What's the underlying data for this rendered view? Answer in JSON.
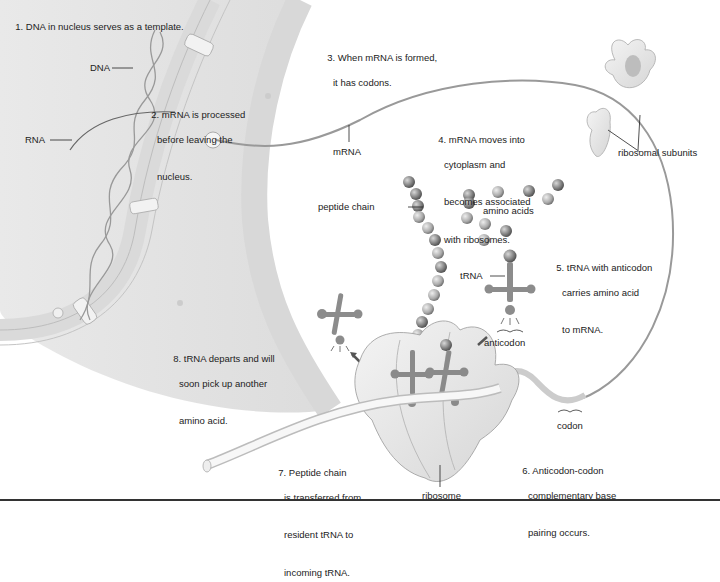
{
  "figure": {
    "type": "protein-synthesis-diagram",
    "steps": [
      {
        "n": "1.",
        "lines": [
          "DNA in nucleus serves as a template."
        ]
      },
      {
        "n": "2.",
        "lines": [
          "mRNA is processed",
          "before leaving the",
          "nucleus."
        ]
      },
      {
        "n": "3.",
        "lines": [
          "When mRNA is formed,",
          "it has codons."
        ]
      },
      {
        "n": "4.",
        "lines": [
          "mRNA moves into",
          "cytoplasm and",
          "becomes associated",
          "with ribosomes."
        ]
      },
      {
        "n": "5.",
        "lines": [
          "tRNA with anticodon",
          "carries amino acid",
          "to mRNA."
        ]
      },
      {
        "n": "6.",
        "lines": [
          "Anticodon-codon",
          "complementary base",
          "pairing occurs."
        ]
      },
      {
        "n": "7.",
        "lines": [
          "Peptide chain",
          "is transferred from",
          "resident tRNA to",
          "incoming tRNA."
        ]
      },
      {
        "n": "8.",
        "lines": [
          "tRNA departs and will",
          "soon pick up another",
          "amino acid."
        ]
      }
    ],
    "labels": {
      "dna": "DNA",
      "rna": "RNA",
      "mrna": "mRNA",
      "ribosomal_subunits": "ribosomal subunits",
      "peptide_chain": "peptide chain",
      "amino_acids": "amino acids",
      "trna": "tRNA",
      "anticodon": "anticodon",
      "codon": "codon",
      "ribosome": "ribosome"
    },
    "colors": {
      "nucleus_fill": "#e6e6e6",
      "membrane": "#cfcfcf",
      "line": "#333333",
      "amino_acid": "#8a8a8a",
      "trna": "#8c8c8c",
      "ribosome_fill": "#ececec"
    }
  }
}
